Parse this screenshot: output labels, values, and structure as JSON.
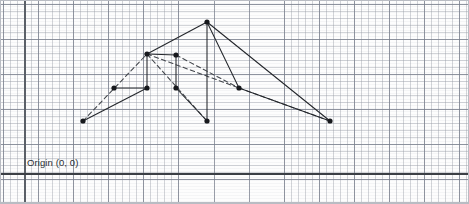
{
  "figure": {
    "background_color": "#fdfdfd",
    "frame_color": "#b9bcc3",
    "grid": {
      "minor_spacing_px": 7,
      "major_spacing_px": 35,
      "minor_color": "#969baa",
      "major_color": "#787e8c",
      "visible": true
    },
    "axes": {
      "vertical_x_px": 24,
      "horizontal_y_px": 173,
      "color": "#3b3f45",
      "origin_label": "Origin (0, 0)",
      "origin_label_x_px": 27,
      "origin_label_y_px": 156
    }
  },
  "chart_data": {
    "type": "scatter",
    "xlabel": "",
    "ylabel": "",
    "grid": true,
    "legend": "none",
    "xlim": [
      0,
      469
    ],
    "ylim": [
      0,
      204
    ],
    "annotations": [
      {
        "text": "Origin (0, 0)",
        "x": 27,
        "y": 163
      }
    ],
    "nodes": [
      {
        "id": "n1",
        "label": "",
        "x": 83,
        "y": 121
      },
      {
        "id": "n2",
        "label": "",
        "x": 114,
        "y": 88
      },
      {
        "id": "n3",
        "label": "",
        "x": 147,
        "y": 88
      },
      {
        "id": "n4",
        "label": "",
        "x": 147,
        "y": 54
      },
      {
        "id": "n5",
        "label": "",
        "x": 176,
        "y": 55
      },
      {
        "id": "n6",
        "label": "",
        "x": 176,
        "y": 88
      },
      {
        "id": "n7",
        "label": "",
        "x": 207,
        "y": 22
      },
      {
        "id": "n8",
        "label": "",
        "x": 207,
        "y": 121
      },
      {
        "id": "n9",
        "label": "",
        "x": 239,
        "y": 88
      },
      {
        "id": "n10",
        "label": "",
        "x": 330,
        "y": 121
      }
    ],
    "edges": [
      {
        "from": "n1",
        "to": "n3",
        "style": "solid"
      },
      {
        "from": "n2",
        "to": "n3",
        "style": "solid"
      },
      {
        "from": "n3",
        "to": "n4",
        "style": "solid"
      },
      {
        "from": "n4",
        "to": "n5",
        "style": "solid"
      },
      {
        "from": "n5",
        "to": "n6",
        "style": "solid"
      },
      {
        "from": "n4",
        "to": "n7",
        "style": "solid"
      },
      {
        "from": "n6",
        "to": "n8",
        "style": "solid"
      },
      {
        "from": "n7",
        "to": "n8",
        "style": "solid"
      },
      {
        "from": "n7",
        "to": "n9",
        "style": "solid"
      },
      {
        "from": "n7",
        "to": "n10",
        "style": "solid"
      },
      {
        "from": "n9",
        "to": "n10",
        "style": "solid"
      },
      {
        "from": "n1",
        "to": "n4",
        "style": "dashed"
      },
      {
        "from": "n4",
        "to": "n9",
        "style": "dashed"
      },
      {
        "from": "n4",
        "to": "n8",
        "style": "dashed"
      },
      {
        "from": "n5",
        "to": "n9",
        "style": "dashed"
      },
      {
        "from": "n9",
        "to": "n10",
        "style": "dashed"
      }
    ],
    "node_color": "#17191d",
    "edge_solid_color": "#23262b",
    "edge_dashed_color": "#41454b",
    "node_radius_px": 2.6
  }
}
